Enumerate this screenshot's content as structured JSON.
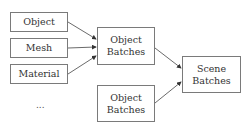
{
  "diagram": {
    "inputs": [
      {
        "label": "Object"
      },
      {
        "label": "Mesh"
      },
      {
        "label": "Material"
      }
    ],
    "ellipsis": "...",
    "batches": [
      {
        "label": "Object\nBatches"
      },
      {
        "label": "Object\nBatches"
      }
    ],
    "output": {
      "label": "Scene\nBatches"
    },
    "colors": {
      "border": "#7a7a7a",
      "arrow": "#333333"
    }
  }
}
